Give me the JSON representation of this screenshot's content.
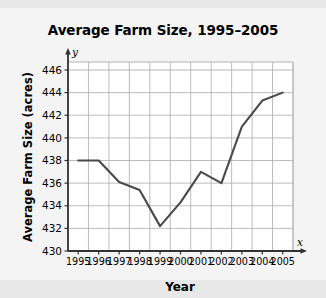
{
  "chart_data": {
    "type": "line",
    "title": "Average Farm Size, 1995–2005",
    "xlabel": "Year",
    "ylabel": "Average Farm Size (acres)",
    "x_axis_letter": "x",
    "y_axis_letter": "y",
    "categories": [
      "1995",
      "1996",
      "1997",
      "1998",
      "1999",
      "2000",
      "2001",
      "2002",
      "2003",
      "2004",
      "2005"
    ],
    "values": [
      438,
      438,
      436.1,
      435.4,
      432.2,
      434.3,
      437,
      436,
      441,
      443.3,
      444
    ],
    "series": [
      {
        "name": "Average Farm Size",
        "values": [
          438,
          438,
          436.1,
          435.4,
          432.2,
          434.3,
          437,
          436,
          441,
          443.3,
          444
        ]
      }
    ],
    "ylim": [
      430,
      446
    ],
    "xlim": [
      "1995",
      "2005"
    ],
    "ytick_labels": [
      "430",
      "432",
      "434",
      "436",
      "438",
      "440",
      "442",
      "444",
      "446"
    ],
    "ytick_values": [
      430,
      432,
      434,
      436,
      438,
      440,
      442,
      444,
      446
    ],
    "grid": true,
    "legend": "none",
    "line_color": "#4a4a4a",
    "grid_color": "#b4b4b4",
    "axis_color": "#333333",
    "plot_background": "#ffffff",
    "figure_background": "#f4f4f4"
  }
}
